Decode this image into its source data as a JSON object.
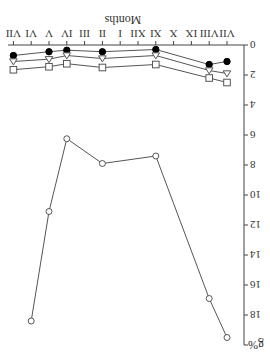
{
  "chart_data": {
    "type": "line",
    "orientation_note": "figure displayed rotated 180 degrees",
    "title": "",
    "xlabel": "Months",
    "ylabel": "g%",
    "categories": [
      "VII",
      "VIII",
      "IX",
      "X",
      "XI",
      "XII",
      "I",
      "II",
      "III",
      "IV",
      "V",
      "VI",
      "VII"
    ],
    "yticks": [
      "0",
      "2",
      "4",
      "6",
      "8",
      "10",
      "12",
      "14",
      "16",
      "18"
    ],
    "ylim": [
      0,
      20
    ],
    "grid": false,
    "series": [
      {
        "name": "filled-circle",
        "marker": "filled-circle",
        "points": [
          [
            0,
            1.1
          ],
          [
            1,
            1.3
          ],
          [
            4,
            0.3
          ],
          [
            7,
            0.45
          ],
          [
            9,
            0.35
          ],
          [
            10,
            0.45
          ],
          [
            12,
            0.7
          ]
        ]
      },
      {
        "name": "triangle",
        "marker": "open-triangle-down",
        "points": [
          [
            0,
            1.9
          ],
          [
            1,
            1.7
          ],
          [
            4,
            0.7
          ],
          [
            7,
            0.9
          ],
          [
            9,
            0.7
          ],
          [
            10,
            0.95
          ],
          [
            12,
            1.1
          ]
        ]
      },
      {
        "name": "square",
        "marker": "open-square",
        "points": [
          [
            0,
            2.5
          ],
          [
            1,
            2.2
          ],
          [
            4,
            1.3
          ],
          [
            7,
            1.5
          ],
          [
            9,
            1.25
          ],
          [
            10,
            1.45
          ],
          [
            12,
            1.65
          ]
        ]
      },
      {
        "name": "open-circle",
        "marker": "open-circle",
        "points": [
          [
            0,
            19.5
          ],
          [
            1,
            16.9
          ],
          [
            4,
            7.4
          ],
          [
            7,
            7.9
          ],
          [
            9,
            6.25
          ],
          [
            10,
            11.1
          ],
          [
            11,
            18.4
          ]
        ]
      }
    ]
  }
}
